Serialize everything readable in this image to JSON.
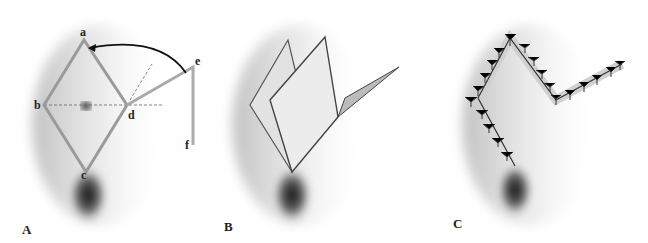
{
  "figure": {
    "panels": [
      {
        "id": "A",
        "label": "A",
        "description": "Rhombic excision a-b-c-d with flap lines d-e and e-f; arrow shows rotation of e toward a",
        "vertices": {
          "a": "a",
          "b": "b",
          "c": "c",
          "d": "d",
          "e": "e",
          "f": "f"
        }
      },
      {
        "id": "B",
        "label": "B",
        "description": "Flap raised and rotated into defect"
      },
      {
        "id": "C",
        "label": "C",
        "description": "Closed wound with interrupted sutures"
      }
    ],
    "colors": {
      "line": "#9a9a9a",
      "arrow": "#111111",
      "skin_shadow": "#6a6a6a",
      "suture": "#333333"
    }
  }
}
